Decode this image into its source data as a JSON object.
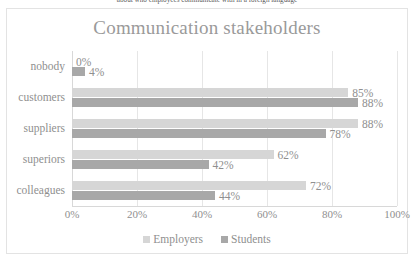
{
  "caption": "about who employees communicate with in a foreign language",
  "chart_data": {
    "type": "bar",
    "orientation": "horizontal",
    "title": "Communication stakeholders",
    "xlabel": "",
    "ylabel": "",
    "xlim": [
      0,
      100
    ],
    "xticks": [
      "0%",
      "20%",
      "40%",
      "60%",
      "80%",
      "100%"
    ],
    "xtick_values": [
      0,
      20,
      40,
      60,
      80,
      100
    ],
    "grid": true,
    "legend_position": "bottom",
    "categories": [
      "nobody",
      "customers",
      "suppliers",
      "superiors",
      "colleagues"
    ],
    "series": [
      {
        "name": "Employers",
        "color": "#d6d6d6",
        "values": [
          0,
          85,
          88,
          62,
          72
        ],
        "labels": [
          "0%",
          "85%",
          "88%",
          "62%",
          "72%"
        ]
      },
      {
        "name": "Students",
        "color": "#a8a8a8",
        "values": [
          4,
          88,
          78,
          42,
          44
        ],
        "labels": [
          "4%",
          "88%",
          "78%",
          "42%",
          "44%"
        ]
      }
    ]
  }
}
